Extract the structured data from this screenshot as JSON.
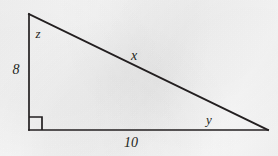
{
  "figure": {
    "kind": "right-triangle-diagram",
    "stroke_color": "#231f20",
    "background_color": "#fbfbfb",
    "vertices": {
      "top": [
        29,
        14
      ],
      "bottom_left": [
        29,
        130
      ],
      "bottom_right": [
        268,
        130
      ]
    },
    "right_angle_marker": {
      "at": "bottom_left",
      "size": 13
    },
    "labels": {
      "vertical_leg": "8",
      "horizontal_leg": "10",
      "hypotenuse": "x",
      "angle_top": "z",
      "angle_bottom_right": "y"
    }
  }
}
